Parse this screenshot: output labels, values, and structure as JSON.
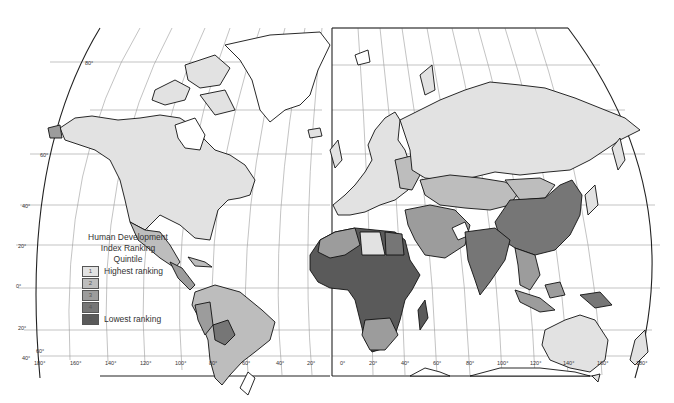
{
  "map": {
    "title": "Human Development Index Ranking",
    "projection": "interrupted",
    "legend": {
      "title_line1": "Human Development",
      "title_line2": "Index Ranking",
      "subtitle": "Quintile",
      "items": [
        {
          "quintile": "1",
          "label": "Highest ranking",
          "color": "#e2e2e2"
        },
        {
          "quintile": "2",
          "label": "",
          "color": "#bdbdbd"
        },
        {
          "quintile": "3",
          "label": "",
          "color": "#9c9c9c"
        },
        {
          "quintile": "4",
          "label": "",
          "color": "#767676"
        },
        {
          "quintile": "5",
          "label": "Lowest ranking",
          "color": "#5a5a5a"
        }
      ]
    },
    "latitude_labels": [
      "80°",
      "60°",
      "40°",
      "20°",
      "0°",
      "20°",
      "40°",
      "60°"
    ],
    "longitude_labels": [
      "180°",
      "160°",
      "140°",
      "120°",
      "100°",
      "80°",
      "60°",
      "40°",
      "20°",
      "0°",
      "20°",
      "40°",
      "60°",
      "80°",
      "100°",
      "120°",
      "140°",
      "160°",
      "180°"
    ],
    "colors": {
      "q1": "#e2e2e2",
      "q2": "#bdbdbd",
      "q3": "#9c9c9c",
      "q4": "#767676",
      "q5": "#5a5a5a",
      "no_data": "#ffffff",
      "coast": "#111111",
      "grid": "#9a9a9a"
    },
    "regions": [
      {
        "name": "North America (USA, Canada)",
        "quintile": 1
      },
      {
        "name": "Greenland",
        "quintile": null
      },
      {
        "name": "Mexico",
        "quintile": 2
      },
      {
        "name": "Central America",
        "quintile": 3
      },
      {
        "name": "South America (Brazil, Argentina, Chile)",
        "quintile": 2
      },
      {
        "name": "Bolivia",
        "quintile": 4
      },
      {
        "name": "Peru / Ecuador",
        "quintile": 3
      },
      {
        "name": "Western Europe",
        "quintile": 1
      },
      {
        "name": "Eastern Europe",
        "quintile": 2
      },
      {
        "name": "Russia",
        "quintile": 1
      },
      {
        "name": "Central Asia",
        "quintile": 2
      },
      {
        "name": "Mongolia",
        "quintile": 3
      },
      {
        "name": "China",
        "quintile": 4
      },
      {
        "name": "India / South Asia",
        "quintile": 4
      },
      {
        "name": "Afghanistan",
        "quintile": null
      },
      {
        "name": "Middle East",
        "quintile": 3
      },
      {
        "name": "North Africa",
        "quintile": 3
      },
      {
        "name": "Libya",
        "quintile": 1
      },
      {
        "name": "Sub-Saharan Africa",
        "quintile": 5
      },
      {
        "name": "Southern Africa",
        "quintile": 3
      },
      {
        "name": "Madagascar",
        "quintile": 5
      },
      {
        "name": "Southeast Asia",
        "quintile": 3
      },
      {
        "name": "Indonesia",
        "quintile": 3
      },
      {
        "name": "Papua New Guinea",
        "quintile": 4
      },
      {
        "name": "Japan",
        "quintile": 1
      },
      {
        "name": "Australia",
        "quintile": 1
      },
      {
        "name": "New Zealand",
        "quintile": 1
      }
    ]
  }
}
